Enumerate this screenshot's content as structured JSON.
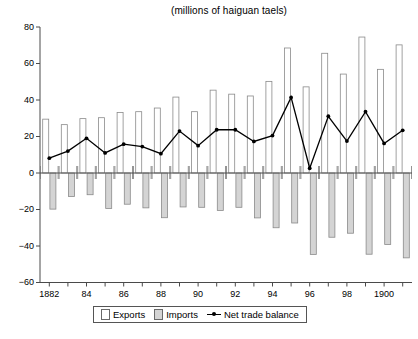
{
  "chart_data": {
    "type": "bar",
    "title": "(millions of haiguan taels)",
    "xlabel": "",
    "ylabel": "",
    "ylim": [
      -60,
      80
    ],
    "yticks": [
      -60,
      -40,
      -20,
      0,
      20,
      40,
      60,
      80
    ],
    "ytick_labels": [
      "−60",
      "−40",
      "−20",
      "0",
      "20",
      "40",
      "60",
      "80"
    ],
    "grid": false,
    "legend_position": "bottom",
    "x": [
      1882,
      1883,
      1884,
      1885,
      1886,
      1887,
      1888,
      1889,
      1890,
      1891,
      1892,
      1893,
      1894,
      1895,
      1896,
      1897,
      1898,
      1899,
      1900,
      1901
    ],
    "categories": [
      "1882",
      "1883",
      "1884",
      "1885",
      "1886",
      "1887",
      "1888",
      "1889",
      "1890",
      "1891",
      "1892",
      "1893",
      "1894",
      "1895",
      "1896",
      "1897",
      "1898",
      "1899",
      "1900",
      "1901"
    ],
    "xtick_labels": [
      "1882",
      "",
      "84",
      "",
      "86",
      "",
      "88",
      "",
      "90",
      "",
      "92",
      "",
      "94",
      "",
      "96",
      "",
      "98",
      "",
      "1900",
      ""
    ],
    "series": [
      {
        "name": "Exports",
        "type": "bar",
        "color": "#ffffff",
        "edge": "#8a8a8a",
        "values": [
          29.5,
          26.5,
          29.8,
          30.3,
          33.2,
          33.6,
          35.6,
          41.6,
          33.6,
          45.4,
          43.2,
          42.2,
          50.2,
          68.5,
          47.2,
          65.6,
          54.2,
          74.5,
          56.8,
          70.2
        ]
      },
      {
        "name": "Imports",
        "type": "bar",
        "color": "#d4d4d4",
        "edge": "#8a8a8a",
        "values": [
          -19.8,
          -12.9,
          -11.9,
          -19.4,
          -17.1,
          -19.1,
          -24.5,
          -18.6,
          -18.8,
          -20.5,
          -18.8,
          -24.6,
          -30.0,
          -27.4,
          -44.6,
          -35.2,
          -33.0,
          -44.5,
          -39.2,
          -46.5
        ]
      },
      {
        "name": "Net trade balance",
        "type": "line",
        "color": "#000000",
        "values": [
          8.1,
          12.0,
          19.0,
          11.0,
          15.8,
          14.5,
          10.6,
          23.0,
          15.0,
          23.7,
          23.7,
          17.3,
          20.5,
          41.4,
          2.6,
          31.1,
          17.5,
          33.6,
          16.2,
          23.4
        ]
      }
    ],
    "legend": [
      "Exports",
      "Imports",
      "Net trade balance"
    ]
  }
}
